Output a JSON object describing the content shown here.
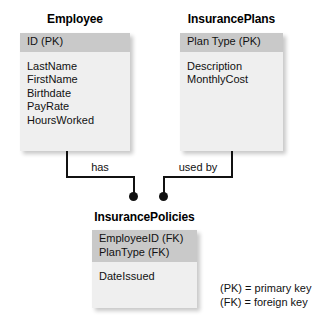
{
  "diagram": {
    "entities": [
      {
        "name": "Employee",
        "key_attribute": "ID (PK)",
        "attributes": [
          "LastName",
          "FirstName",
          "Birthdate",
          "PayRate",
          "HoursWorked"
        ]
      },
      {
        "name": "InsurancePlans",
        "key_attribute": "Plan Type (PK)",
        "attributes": [
          "Description",
          "MonthlyCost"
        ]
      },
      {
        "name": "InsurancePolicies",
        "key_attributes": [
          "EmployeeID (FK)",
          "PlanType (FK)"
        ],
        "attributes": [
          "DateIssued"
        ]
      }
    ],
    "relationships": [
      {
        "label": "has",
        "from": "Employee",
        "to": "InsurancePolicies"
      },
      {
        "label": "used by",
        "from": "InsurancePlans",
        "to": "InsurancePolicies"
      }
    ],
    "legend": [
      "(PK) = primary key",
      "(FK) = foreign key"
    ],
    "colors": {
      "header_fill": "#c9c9c9",
      "body_fill": "#efefef",
      "line": "#111111",
      "text": "#111111",
      "background": "#ffffff"
    }
  }
}
